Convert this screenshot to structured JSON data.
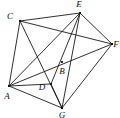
{
  "figure": {
    "type": "graph-diagram",
    "width": 120,
    "height": 118,
    "background_color": "#ffffff",
    "edge_color": "#1a1a1a",
    "vertex_color": "#111111",
    "label_style": "italic-serif"
  },
  "vertices": [
    {
      "id": "A",
      "label": "A",
      "x": 9,
      "y": 86,
      "label_x": 7,
      "label_y": 97,
      "dot_size": 2.0
    },
    {
      "id": "B",
      "label": "B",
      "x": 62,
      "y": 62,
      "label_x": 62,
      "label_y": 72,
      "dot_size": 1.9
    },
    {
      "id": "C",
      "label": "C",
      "x": 20,
      "y": 21,
      "label_x": 10,
      "label_y": 17,
      "dot_size": 2.0
    },
    {
      "id": "D",
      "label": "D",
      "x": 51,
      "y": 84,
      "label_x": 42,
      "label_y": 88,
      "dot_size": 1.8
    },
    {
      "id": "E",
      "label": "E",
      "x": 80,
      "y": 13,
      "label_x": 79,
      "label_y": 5,
      "dot_size": 2.0
    },
    {
      "id": "F",
      "label": "F",
      "x": 112,
      "y": 44,
      "label_x": 116,
      "label_y": 45,
      "dot_size": 2.0
    },
    {
      "id": "G",
      "label": "G",
      "x": 62,
      "y": 108,
      "label_x": 62,
      "label_y": 116,
      "dot_size": 2.1
    }
  ],
  "edges": [
    {
      "id": "A-C",
      "from": "A",
      "to": "C"
    },
    {
      "id": "A-E",
      "from": "A",
      "to": "E"
    },
    {
      "id": "A-F",
      "from": "A",
      "to": "F"
    },
    {
      "id": "A-D",
      "from": "A",
      "to": "D"
    },
    {
      "id": "A-G",
      "from": "A",
      "to": "G"
    },
    {
      "id": "C-E",
      "from": "C",
      "to": "E"
    },
    {
      "id": "C-F",
      "from": "C",
      "to": "F"
    },
    {
      "id": "C-G",
      "from": "C",
      "to": "G"
    },
    {
      "id": "E-F",
      "from": "E",
      "to": "F"
    },
    {
      "id": "E-G",
      "from": "E",
      "to": "G"
    },
    {
      "id": "E-D",
      "from": "E",
      "to": "D"
    },
    {
      "id": "F-G",
      "from": "F",
      "to": "G"
    },
    {
      "id": "D-G",
      "from": "D",
      "to": "G"
    }
  ],
  "counts": {
    "vertex_count": 7,
    "edge_count": 13
  }
}
